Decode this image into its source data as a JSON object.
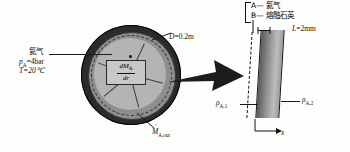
{
  "figure": {
    "accent_color": "#1a1a1a"
  },
  "legend": {
    "items": [
      {
        "key": "A",
        "dash": "—",
        "label": "氦气"
      },
      {
        "key": "B",
        "dash": "—",
        "label": "熔融石英"
      }
    ]
  },
  "sphere": {
    "gas_label": "氦气",
    "pressure": "p",
    "pressure_sub": "A",
    "pressure_value": "=4bar",
    "temperature": "T=20℃",
    "diameter_symbol": "D",
    "diameter_value": "=0.2m",
    "flux_box_numerator": "dM",
    "flux_box_numerator_sub": "A",
    "flux_box_denominator": "dr",
    "outflow_symbol": "M",
    "outflow_sub": "A,out"
  },
  "wall": {
    "thickness_symbol": "L",
    "thickness_value": "=2mm",
    "density_inner_symbol": "ρ",
    "density_inner_sub": "A,1",
    "density_outer_symbol": "ρ",
    "density_outer_sub": "A,2",
    "axis_label": "x"
  }
}
